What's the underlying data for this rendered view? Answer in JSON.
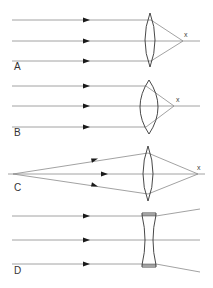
{
  "diagram": {
    "colors": {
      "ray": "#8a8a8a",
      "lens": "#333333",
      "arrow": "#1a1a1a",
      "label": "#333333"
    },
    "panels": [
      {
        "id": "A",
        "label": "A",
        "lens_type": "thin biconvex",
        "focus_label": "x",
        "description": "Parallel rays converge to focal point"
      },
      {
        "id": "B",
        "label": "B",
        "lens_type": "thick biconvex",
        "focus_label": "x",
        "description": "Parallel rays converge to nearer focal point"
      },
      {
        "id": "C",
        "label": "C",
        "lens_type": "thin biconvex",
        "focus_label": "x",
        "description": "Rays from point source converge to image point"
      },
      {
        "id": "D",
        "label": "D",
        "lens_type": "biconcave",
        "focus_label": "",
        "description": "Parallel rays diverge"
      }
    ]
  }
}
